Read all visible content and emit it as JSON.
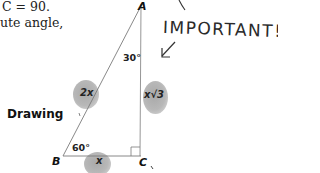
{
  "text": {
    "line1": "C = 90.",
    "line2": "ute angle,",
    "drawing_label": "Drawing"
  },
  "triangle": {
    "vertices": {
      "A": "A",
      "B": "B",
      "C": "C"
    },
    "angles": {
      "A": "30°",
      "B": "60°",
      "C": "90°"
    },
    "sides": {
      "AB": "2x",
      "AC": "x√3",
      "BC": "x"
    }
  },
  "annotation": {
    "handwritten_note": "IMPORTANT!"
  }
}
